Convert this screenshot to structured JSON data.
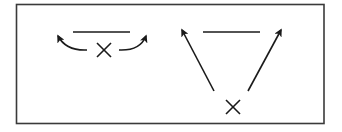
{
  "figure": {
    "frame": {
      "x": 16.5,
      "y": 4.5,
      "width": 307.5,
      "height": 119,
      "stroke": "#3a3a3a"
    },
    "colors": {
      "ink": "#1a1a1a",
      "background": "#ffffff"
    },
    "left_panel": {
      "bar": {
        "x1": 73,
        "y1": 32,
        "x2": 130,
        "y2": 32
      },
      "cross": {
        "cx": 104,
        "cy": 50,
        "half": 7
      },
      "arrows": [
        {
          "name": "left-curved-arrow",
          "path": "M 87 50 Q 66 51 58 36",
          "tip": [
            56,
            33
          ],
          "angle": 240
        },
        {
          "name": "right-curved-arrow",
          "path": "M 119 50 Q 140 51 146 36",
          "tip": [
            147,
            33
          ],
          "angle": 300
        }
      ]
    },
    "right_panel": {
      "bar": {
        "x1": 203,
        "y1": 32,
        "x2": 260,
        "y2": 32
      },
      "cross": {
        "cx": 233,
        "cy": 107,
        "half": 7
      },
      "arrows": [
        {
          "name": "left-diagonal-arrow",
          "x1": 214,
          "y1": 91,
          "x2": 182,
          "y2": 30
        },
        {
          "name": "right-diagonal-arrow",
          "x1": 248,
          "y1": 91,
          "x2": 281,
          "y2": 30
        }
      ]
    }
  }
}
